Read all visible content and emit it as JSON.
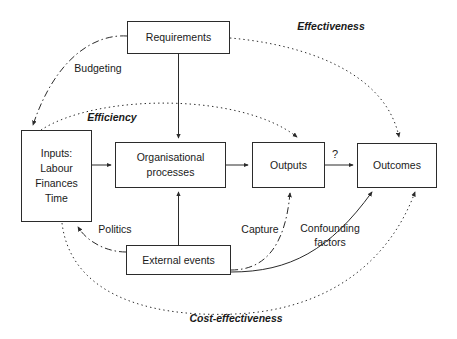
{
  "diagram": {
    "background_color": "#ffffff",
    "stroke_color": "#2b2b2b",
    "text_color": "#1a1a1a",
    "nodes": [
      {
        "id": "requirements",
        "label": "Requirements",
        "lines": [
          "Requirements"
        ],
        "x": 127,
        "y": 21,
        "w": 103,
        "h": 33
      },
      {
        "id": "inputs",
        "label": "Inputs: Labour Finances Time",
        "lines": [
          "Inputs:",
          "Labour",
          "Finances",
          "Time"
        ],
        "x": 21,
        "y": 130,
        "w": 71,
        "h": 92
      },
      {
        "id": "organisational-processes",
        "label": "Organisational processes",
        "lines": [
          "Organisational",
          "processes"
        ],
        "x": 115,
        "y": 142,
        "w": 111,
        "h": 46
      },
      {
        "id": "outputs",
        "label": "Outputs",
        "lines": [
          "Outputs"
        ],
        "x": 252,
        "y": 142,
        "w": 73,
        "h": 46
      },
      {
        "id": "outcomes",
        "label": "Outcomes",
        "lines": [
          "Outcomes"
        ],
        "x": 357,
        "y": 143,
        "w": 80,
        "h": 45
      },
      {
        "id": "external-events",
        "label": "External events",
        "lines": [
          "External events"
        ],
        "x": 126,
        "y": 245,
        "w": 105,
        "h": 30
      }
    ],
    "edge_labels": [
      {
        "id": "effectiveness",
        "text": "Effectiveness",
        "style": "bold-italic",
        "x": 288,
        "y": 20,
        "w": 86
      },
      {
        "id": "budgeting",
        "text": "Budgeting",
        "style": "regular",
        "x": 70,
        "y": 62,
        "w": 56
      },
      {
        "id": "efficiency",
        "text": "Efficiency",
        "style": "bold-italic",
        "x": 86,
        "y": 111,
        "w": 52
      },
      {
        "id": "politics",
        "text": "Politics",
        "style": "regular",
        "x": 94,
        "y": 223,
        "w": 42
      },
      {
        "id": "capture",
        "text": "Capture",
        "style": "regular",
        "x": 238,
        "y": 223,
        "w": 44
      },
      {
        "id": "confounding-factors",
        "text": "Confounding factors",
        "style": "regular",
        "x": 296,
        "y": 221,
        "w": 68
      },
      {
        "id": "cost-effectiveness",
        "text": "Cost-effectiveness",
        "style": "bold-italic",
        "x": 184,
        "y": 312,
        "w": 104
      },
      {
        "id": "question-mark",
        "text": "?",
        "style": "regular",
        "x": 332,
        "y": 148,
        "w": 8
      }
    ],
    "connectors": [
      {
        "id": "requirements-to-processes",
        "from": "requirements",
        "to": "organisational-processes",
        "line": "solid"
      },
      {
        "id": "inputs-to-processes",
        "from": "inputs",
        "to": "organisational-processes",
        "line": "solid"
      },
      {
        "id": "processes-to-outputs",
        "from": "organisational-processes",
        "to": "outputs",
        "line": "solid"
      },
      {
        "id": "outputs-to-outcomes",
        "from": "outputs",
        "to": "outcomes",
        "line": "solid",
        "label": "?"
      },
      {
        "id": "events-to-processes",
        "from": "external-events",
        "to": "organisational-processes",
        "line": "solid"
      },
      {
        "id": "budgeting-edge",
        "from": "requirements",
        "to": "inputs",
        "line": "dash-dot",
        "label": "Budgeting"
      },
      {
        "id": "politics-edge",
        "from": "external-events",
        "to": "inputs",
        "line": "dash-dot",
        "label": "Politics"
      },
      {
        "id": "capture-edge",
        "from": "external-events",
        "to": "outputs",
        "line": "dash-dot",
        "label": "Capture"
      },
      {
        "id": "confounding-edge",
        "from": "external-events",
        "to": "outcomes",
        "line": "solid",
        "label": "Confounding factors"
      },
      {
        "id": "effectiveness-edge",
        "from": "requirements",
        "to": "outcomes",
        "line": "dotted",
        "label": "Effectiveness"
      },
      {
        "id": "efficiency-edge",
        "from": "inputs",
        "to": "outputs",
        "line": "dotted",
        "label": "Efficiency"
      },
      {
        "id": "cost-effectiveness-edge",
        "from": "inputs",
        "to": "outcomes",
        "line": "dotted",
        "label": "Cost-effectiveness"
      }
    ]
  }
}
